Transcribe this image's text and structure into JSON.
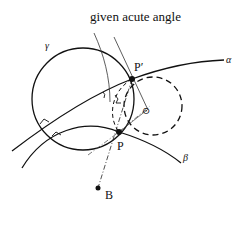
{
  "diagram": {
    "caption_label": "given acute angle",
    "curves": {
      "alpha": {
        "label": "α"
      },
      "beta": {
        "label": "β"
      },
      "gamma": {
        "label": "γ"
      }
    },
    "points": {
      "p_prime": {
        "label": "P′"
      },
      "p": {
        "label": "P"
      },
      "b": {
        "label": "B"
      }
    },
    "marks": {
      "circled_point": "⊙"
    },
    "colors": {
      "ink": "#111111",
      "background": "#ffffff"
    }
  }
}
